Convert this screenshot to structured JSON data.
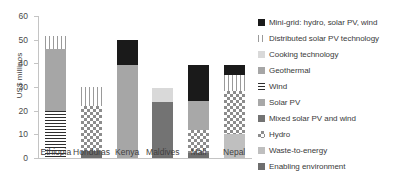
{
  "chart_data": {
    "type": "bar",
    "stacked": true,
    "title": "",
    "xlabel": "",
    "ylabel": "US$ millinos",
    "ylim": [
      0,
      60
    ],
    "yticks": [
      0,
      10,
      20,
      30,
      40,
      50,
      60
    ],
    "ytick_labels": [
      "0",
      "10",
      "20",
      "30",
      "40",
      "50",
      "60"
    ],
    "grid": false,
    "legend_position": "right",
    "categories": [
      "Ethiopia",
      "Honduras",
      "Kenya",
      "Maldives",
      "Mali",
      "Nepal"
    ],
    "series": [
      {
        "name": "Enabling environment",
        "color": "#6e6e6e",
        "pattern": "solid",
        "values": [
          0,
          3.0,
          0,
          0.8,
          2.0,
          0
        ]
      },
      {
        "name": "Waste-to-energy",
        "color": "#bfbfbf",
        "pattern": "solid",
        "values": [
          0,
          0,
          0,
          0,
          0,
          10.0
        ]
      },
      {
        "name": "Hydro",
        "color": "#8c8c8c",
        "pattern": "checkerboard",
        "values": [
          0,
          19.0,
          0,
          0,
          10.0,
          18.5
        ]
      },
      {
        "name": "Mixed solar PV and wind",
        "color": "#737373",
        "pattern": "solid",
        "values": [
          0,
          0,
          0,
          23.0,
          0,
          0
        ]
      },
      {
        "name": "Solar PV",
        "color": "#a8a8a8",
        "pattern": "solid",
        "values": [
          0,
          0,
          0,
          0,
          12.0,
          0
        ]
      },
      {
        "name": "Wind",
        "color": "#2e2e2e",
        "pattern": "horizontal-lines",
        "values": [
          20.0,
          0,
          0,
          0,
          0,
          0
        ]
      },
      {
        "name": "Geothermal",
        "color": "#a6a6a6",
        "pattern": "solid",
        "values": [
          26.0,
          0,
          39.5,
          0,
          0,
          0
        ]
      },
      {
        "name": "Cooking technology",
        "color": "#d9d9d9",
        "pattern": "solid",
        "values": [
          0,
          0,
          0,
          5.7,
          0,
          0
        ]
      },
      {
        "name": "Distributed solar PV technology",
        "color": "#9a9a9a",
        "pattern": "vertical-lines",
        "values": [
          5.5,
          8.0,
          0,
          0,
          0,
          6.5
        ]
      },
      {
        "name": "Mini-grid: hydro, solar PV, wind",
        "color": "#1a1a1a",
        "pattern": "solid",
        "values": [
          0,
          0,
          10.2,
          0,
          15.5,
          4.5
        ]
      }
    ],
    "totals": [
      51.5,
      30.0,
      49.7,
      29.5,
      39.5,
      39.5
    ]
  },
  "legend": {
    "items": [
      {
        "label": "Mini-grid: hydro, solar PV, wind",
        "fill": "f-minigrid"
      },
      {
        "label": "Distributed solar PV technology",
        "fill": "f-dsolar"
      },
      {
        "label": "Cooking technology",
        "fill": "f-cooking"
      },
      {
        "label": "Geothermal",
        "fill": "f-geothermal"
      },
      {
        "label": "Wind",
        "fill": "f-wind"
      },
      {
        "label": "Solar PV",
        "fill": "f-solarpv"
      },
      {
        "label": "Mixed solar PV and wind",
        "fill": "f-mixed"
      },
      {
        "label": "Hydro",
        "fill": "f-hydro"
      },
      {
        "label": "Waste-to-energy",
        "fill": "f-waste"
      },
      {
        "label": "Enabling environment",
        "fill": "f-enabling"
      }
    ]
  }
}
